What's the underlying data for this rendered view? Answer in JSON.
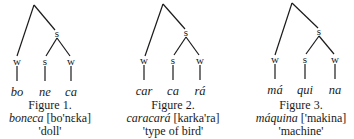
{
  "figures": [
    {
      "label": "Figure 1.",
      "word": "boneca",
      "ipa": "[bo'nɛka]",
      "gloss": "'doll'",
      "tree": {
        "root": "",
        "branch_node": "s",
        "leaves": [
          {
            "stress": "w",
            "syllable": "bo"
          },
          {
            "stress": "s",
            "syllable": "ne"
          },
          {
            "stress": "w",
            "syllable": "ca"
          }
        ]
      }
    },
    {
      "label": "Figure 2.",
      "word": "caracará",
      "ipa": "[karka'ra]",
      "gloss": "'type of bird'",
      "tree": {
        "root": "",
        "branch_node": "s",
        "leaves": [
          {
            "stress": "w",
            "syllable": "car"
          },
          {
            "stress": "s",
            "syllable": "ca"
          },
          {
            "stress": "w",
            "syllable": "rá"
          }
        ]
      }
    },
    {
      "label": "Figure 3.",
      "word": "máquina",
      "ipa": "['makina]",
      "gloss": "'machine'",
      "tree": {
        "root": "",
        "branch_node": "s",
        "leaves": [
          {
            "stress": "w",
            "syllable": "má"
          },
          {
            "stress": "s",
            "syllable": "qui"
          },
          {
            "stress": "w",
            "syllable": "na"
          }
        ]
      }
    }
  ]
}
